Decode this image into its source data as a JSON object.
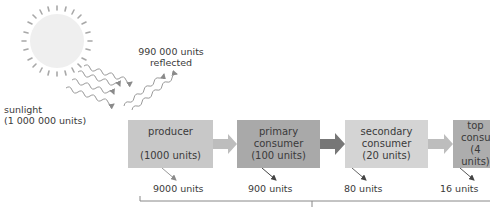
{
  "sunlight": {
    "label": "sunlight",
    "amount": "(1 000 000 units)"
  },
  "reflected": {
    "amount": "990 000 units",
    "label": "reflected"
  },
  "levels": [
    {
      "name_line1": "producer",
      "name_line2": "",
      "units": "(1000 units)",
      "loss": "9000 units",
      "color": "#c8c8c8"
    },
    {
      "name_line1": "primary",
      "name_line2": "consumer",
      "units": "(100 units)",
      "loss": "900 units",
      "color": "#a9a9a9"
    },
    {
      "name_line1": "secondary",
      "name_line2": "consumer",
      "units": "(20 units)",
      "loss": "80 units",
      "color": "#d4d4d4"
    },
    {
      "name_line1": "top",
      "name_line2": "consumer",
      "units": "(4 units)",
      "loss": "16 units",
      "color": "#adadad"
    }
  ],
  "colors": {
    "sun": "#eeeeee",
    "rays": "#9a9a9a",
    "arrow_light": "#bdbdbd",
    "arrow_dark": "#7a7a7a",
    "loss_arrow": "#555555"
  }
}
